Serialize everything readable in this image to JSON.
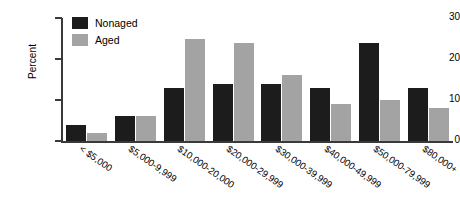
{
  "chart_data": {
    "type": "bar",
    "title": "",
    "xlabel": "",
    "ylabel": "Percent",
    "ylim": [
      0,
      30
    ],
    "yticks": [
      0,
      10,
      20,
      30
    ],
    "grid": false,
    "legend_position": "top-left-inside",
    "categories": [
      "< $5,000",
      "$5,000-9,999",
      "$10,000-20,000",
      "$20,000-29,999",
      "$30,000-39,999",
      "$40,000-49,999",
      "$50,000-79,999",
      "$80,000+"
    ],
    "series": [
      {
        "name": "Nonaged",
        "color": "#1c1c1c",
        "values": [
          4,
          6,
          13,
          14,
          14,
          13,
          24,
          13
        ]
      },
      {
        "name": "Aged",
        "color": "#a3a3a3",
        "values": [
          2,
          6,
          25,
          24,
          16,
          9,
          10,
          8
        ]
      }
    ]
  },
  "legend": {
    "items": [
      {
        "label": "Nonaged",
        "swatch": "nonaged"
      },
      {
        "label": "Aged",
        "swatch": "aged"
      }
    ]
  }
}
